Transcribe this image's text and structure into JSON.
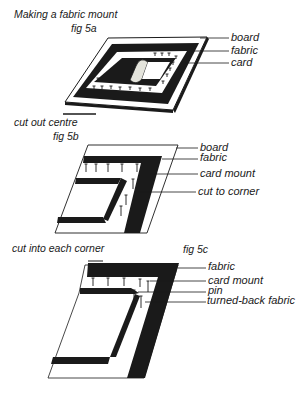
{
  "title": "Making a fabric mount",
  "figures": [
    {
      "id": "fig5a",
      "caption": "fig 5a",
      "labels": [
        "board",
        "fabric",
        "card"
      ],
      "note": "cut out centre"
    },
    {
      "id": "fig5b",
      "caption": "fig 5b",
      "labels": [
        "board",
        "fabric",
        "card mount",
        "cut to corner"
      ],
      "note": "cut into each corner"
    },
    {
      "id": "fig5c",
      "caption": "fig 5c",
      "labels": [
        "fabric",
        "card mount",
        "pin",
        "turned-back fabric"
      ]
    }
  ],
  "colors": {
    "ink": "#1a1a1a",
    "paper": "#ffffff",
    "card_shade": "#d8d8d0"
  }
}
